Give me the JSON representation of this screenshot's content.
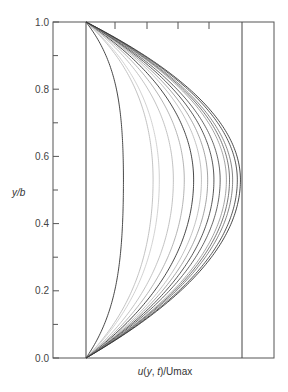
{
  "chart_data": {
    "type": "line",
    "title": "",
    "xlabel": "u(y, t)/Umax",
    "ylabel": "y/b",
    "xlim": [
      0,
      1
    ],
    "ylim": [
      0.0,
      1.0
    ],
    "grid": false,
    "legend": null,
    "y_ticks": [
      0.0,
      0.2,
      0.4,
      0.6,
      0.8,
      1.0
    ],
    "y_tick_labels": [
      "0.0",
      "0.2",
      "0.4",
      "0.6",
      "0.8",
      "1.0"
    ],
    "y_minor_ticks": [
      0.1,
      0.3,
      0.5,
      0.7,
      0.9
    ],
    "x_ticks_top_fraction": [
      0.0,
      0.2,
      0.4,
      0.6
    ],
    "reference_lines": [
      {
        "orientation": "vertical",
        "x": 0.0,
        "label": "u = 0"
      },
      {
        "orientation": "vertical",
        "x": 1.0,
        "label": "u = Umax"
      }
    ],
    "peak_y": 0.53,
    "series": [
      {
        "name": "t1",
        "peak": 0.24,
        "shade": "#333333"
      },
      {
        "name": "t2",
        "peak": 0.43,
        "shade": "#bbbbbb"
      },
      {
        "name": "t3",
        "peak": 0.47,
        "shade": "#cccccc"
      },
      {
        "name": "t4",
        "peak": 0.56,
        "shade": "#bbbbbb"
      },
      {
        "name": "t5",
        "peak": 0.63,
        "shade": "#aaaaaa"
      },
      {
        "name": "t6",
        "peak": 0.69,
        "shade": "#333333"
      },
      {
        "name": "t7",
        "peak": 0.74,
        "shade": "#bbbbbb"
      },
      {
        "name": "t8",
        "peak": 0.78,
        "shade": "#999999"
      },
      {
        "name": "t9",
        "peak": 0.82,
        "shade": "#444444"
      },
      {
        "name": "t10",
        "peak": 0.86,
        "shade": "#555555"
      },
      {
        "name": "t11",
        "peak": 0.9,
        "shade": "#999999"
      },
      {
        "name": "t12",
        "peak": 0.92,
        "shade": "#666666"
      },
      {
        "name": "t13",
        "peak": 0.94,
        "shade": "#777777"
      },
      {
        "name": "t14",
        "peak": 0.97,
        "shade": "#444444"
      },
      {
        "name": "t15",
        "peak": 0.99,
        "shade": "#333333"
      }
    ]
  },
  "labels": {
    "ylabel": "y/b",
    "xlabel": "u(y, t)/Umax"
  }
}
